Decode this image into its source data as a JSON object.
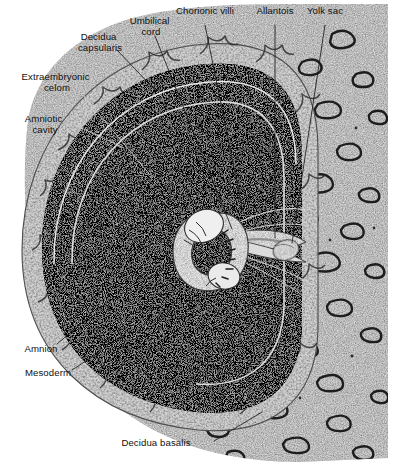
{
  "figure": {
    "background_color": "#ffffff",
    "ink_color": "#111111"
  },
  "labels": [
    {
      "id": "decidua-capsularis",
      "lines": [
        "Decidua",
        "capsularis"
      ],
      "x": 100,
      "y": 40,
      "anchor": "middle"
    },
    {
      "id": "umbilical-cord",
      "lines": [
        "Umbilical",
        "cord"
      ],
      "x": 151,
      "y": 24,
      "anchor": "middle"
    },
    {
      "id": "chorionic-villi",
      "lines": [
        "Chorionic villi"
      ],
      "x": 205,
      "y": 14,
      "anchor": "middle"
    },
    {
      "id": "allantois",
      "lines": [
        "Allantois"
      ],
      "x": 275,
      "y": 14,
      "anchor": "middle"
    },
    {
      "id": "yolk-sac",
      "lines": [
        "Yolk sac"
      ],
      "x": 325,
      "y": 14,
      "anchor": "middle"
    },
    {
      "id": "extraembryonic-celom",
      "lines": [
        "Extraembryonic",
        "celom"
      ],
      "x": 57,
      "y": 80,
      "anchor": "middle"
    },
    {
      "id": "amniotic-cavity",
      "lines": [
        "Amniotic",
        "cavity"
      ],
      "x": 45,
      "y": 122,
      "anchor": "middle"
    },
    {
      "id": "amnion",
      "lines": [
        "Amnion"
      ],
      "x": 41,
      "y": 352,
      "anchor": "middle"
    },
    {
      "id": "mesoderm",
      "lines": [
        "Mesoderm"
      ],
      "x": 48,
      "y": 376,
      "anchor": "middle"
    },
    {
      "id": "decidua-basalis",
      "lines": [
        "Decidua basalis"
      ],
      "x": 156,
      "y": 446,
      "anchor": "middle"
    }
  ],
  "leaders": [
    {
      "id": "leader-decidua-capsularis",
      "path": "M 117 50 L 157 92",
      "tone": "dark"
    },
    {
      "id": "leader-umbilical-cord",
      "path": "M 155 36 L 232 229",
      "tone": "dark"
    },
    {
      "id": "leader-chorionic-villi",
      "path": "M 205 25 L 243 212",
      "tone": "dark"
    },
    {
      "id": "leader-allantois",
      "path": "M 275 25 L 275 238",
      "tone": "dark"
    },
    {
      "id": "leader-yolk-sac",
      "path": "M 325 25 L 292 243",
      "tone": "dark"
    },
    {
      "id": "leader-extraembryonic-celom",
      "path": "M 84 96 L 150 175",
      "tone": "light"
    },
    {
      "id": "leader-amniotic-cavity",
      "path": "M 73 124 L 124 148",
      "tone": "light"
    },
    {
      "id": "leader-amnion",
      "path": "M 57 344 L 88 318",
      "tone": "dark"
    },
    {
      "id": "leader-mesoderm",
      "path": "M 72 370 L 100 352",
      "tone": "dark"
    },
    {
      "id": "leader-decidua-basalis",
      "path": "M 214 441 L 262 412",
      "tone": "dark"
    }
  ],
  "structures": [
    {
      "id": "decidua-mass",
      "name": "decidua / uterine wall"
    },
    {
      "id": "decidua-capsularis-shell",
      "name": "decidua capsularis"
    },
    {
      "id": "chorionic-cavity",
      "name": "extraembryonic celom (dark)"
    },
    {
      "id": "chorion-arc",
      "name": "chorion membrane"
    },
    {
      "id": "amnion-arc",
      "name": "amnion membrane"
    },
    {
      "id": "amniotic-cavity-sac",
      "name": "amniotic cavity"
    },
    {
      "id": "embryo",
      "name": "embryo"
    },
    {
      "id": "umbilical-cord-stalk",
      "name": "umbilical cord / body stalk"
    },
    {
      "id": "yolk-sac-body",
      "name": "yolk sac"
    },
    {
      "id": "allantois-duct",
      "name": "allantois"
    },
    {
      "id": "chorionic-villi-field",
      "name": "chorionic villi"
    }
  ]
}
